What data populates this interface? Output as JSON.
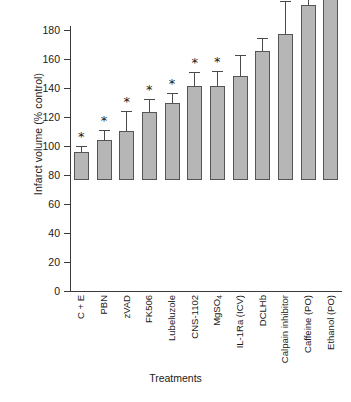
{
  "chart_data": {
    "type": "bar",
    "title": "",
    "xlabel": "Treatments",
    "ylabel": "Infarct volume (% control)",
    "ylim": [
      0,
      180
    ],
    "yticks": [
      0,
      20,
      40,
      60,
      80,
      100,
      120,
      140,
      160,
      180
    ],
    "ytick_labels": [
      "0",
      "20",
      "40",
      "60",
      "80",
      "100",
      "120",
      "140",
      "160",
      "180"
    ],
    "grid": false,
    "legend": null,
    "categories": [
      "C + E",
      "PBN",
      "zVAD",
      "FK506",
      "Lubeluzole",
      "CNS-1102",
      "MgSO4",
      "IL-1Ra (ICV)",
      "DCLHb",
      "Calpain inhibitor",
      "Caffeine (PO)",
      "Ethanol (PO)"
    ],
    "values": [
      19,
      27.5,
      34,
      47,
      53,
      64.5,
      64.5,
      71.5,
      89,
      101,
      121,
      171.5
    ],
    "errors": [
      4,
      6,
      13,
      8,
      6,
      9,
      10,
      14,
      8,
      22,
      10,
      9
    ],
    "significance": [
      "*",
      "*",
      "*",
      "*",
      "*",
      "*",
      "*",
      "",
      "",
      "",
      "",
      "*"
    ],
    "annotation_note": "* denotes statistically significant difference"
  },
  "axis": {
    "y_title": "Infarct volume (% control)",
    "x_title": "Treatments"
  },
  "style": {
    "bar_fill": "#b6b6b6",
    "bar_stroke": "#555555",
    "axis_color": "#3b3b3b",
    "text_color": "#1a1a1a",
    "background": "#ffffff"
  }
}
